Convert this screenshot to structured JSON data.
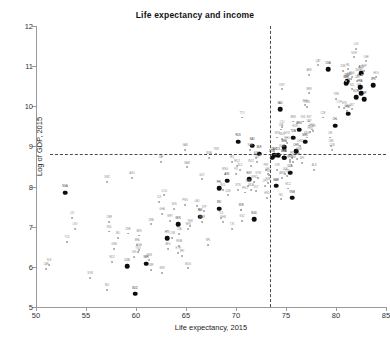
{
  "chart_data": {
    "type": "scatter",
    "title": "Life expectancy and income",
    "xlabel": "Life expectancy, 2015",
    "ylabel": "Log of GDP, 2015",
    "xlim": [
      50,
      85
    ],
    "ylim": [
      5,
      12
    ],
    "xticks": [
      50,
      55,
      60,
      65,
      70,
      75,
      80,
      85
    ],
    "yticks": [
      5,
      6,
      7,
      8,
      9,
      10,
      11,
      12
    ],
    "grid": false,
    "legend": "none",
    "reference_lines": [
      {
        "orientation": "horizontal",
        "value": 8.8,
        "style": "dashed",
        "color": "#4a4a4a"
      },
      {
        "orientation": "vertical",
        "value": 73.4,
        "style": "dashed",
        "color": "#4a4a4a"
      }
    ],
    "marker_styles": {
      "highlighted": {
        "color": "#0d0d0d",
        "size": "large"
      },
      "regular": {
        "color": "#9d9d9d",
        "size": "small"
      }
    },
    "points": [
      {
        "label": "CAF",
        "x": 51.0,
        "y": 5.95,
        "h": false
      },
      {
        "label": "NGA",
        "x": 52.9,
        "y": 7.85,
        "h": true
      },
      {
        "label": "SLE",
        "x": 51.3,
        "y": 6.05,
        "h": false
      },
      {
        "label": "TCD",
        "x": 53.1,
        "y": 6.62,
        "h": false
      },
      {
        "label": "CIV",
        "x": 53.6,
        "y": 7.22,
        "h": false
      },
      {
        "label": "LSO",
        "x": 53.9,
        "y": 6.95,
        "h": false
      },
      {
        "label": "SOM",
        "x": 55.4,
        "y": 5.72,
        "h": false
      },
      {
        "label": "SWZ",
        "x": 57.1,
        "y": 8.12,
        "h": false
      },
      {
        "label": "CMR",
        "x": 57.3,
        "y": 7.12,
        "h": false
      },
      {
        "label": "MLI",
        "x": 58.2,
        "y": 6.72,
        "h": false
      },
      {
        "label": "COD",
        "x": 59.1,
        "y": 6.02,
        "h": true
      },
      {
        "label": "BDI",
        "x": 57.1,
        "y": 5.42,
        "h": false
      },
      {
        "label": "BDI2",
        "x": 59.9,
        "y": 5.33,
        "h": true
      },
      {
        "label": "GNB",
        "x": 57.8,
        "y": 6.44,
        "h": false
      },
      {
        "label": "ZWE",
        "x": 59.2,
        "y": 6.83,
        "h": false
      },
      {
        "label": "AGO",
        "x": 59.6,
        "y": 8.22,
        "h": false
      },
      {
        "label": "BEN",
        "x": 60.3,
        "y": 6.78,
        "h": false
      },
      {
        "label": "GIN",
        "x": 59.8,
        "y": 6.25,
        "h": false
      },
      {
        "label": "BFA",
        "x": 60.1,
        "y": 6.54,
        "h": false
      },
      {
        "label": "MOZ",
        "x": 57.6,
        "y": 6.12,
        "h": false
      },
      {
        "label": "TGO",
        "x": 60.2,
        "y": 6.36,
        "h": false
      },
      {
        "label": "NER",
        "x": 61.0,
        "y": 6.08,
        "h": true
      },
      {
        "label": "UGA",
        "x": 60.3,
        "y": 6.42,
        "h": false
      },
      {
        "label": "ZMB",
        "x": 61.5,
        "y": 7.06,
        "h": false
      },
      {
        "label": "MWI",
        "x": 62.6,
        "y": 5.84,
        "h": false
      },
      {
        "label": "GMB",
        "x": 61.3,
        "y": 6.18,
        "h": false
      },
      {
        "label": "AFG",
        "x": 63.2,
        "y": 6.44,
        "h": false
      },
      {
        "label": "HTI",
        "x": 63.1,
        "y": 6.72,
        "h": true
      },
      {
        "label": "GHA",
        "x": 62.6,
        "y": 7.32,
        "h": false
      },
      {
        "label": "TZA",
        "x": 64.3,
        "y": 6.82,
        "h": false
      },
      {
        "label": "RWA",
        "x": 64.3,
        "y": 6.52,
        "h": false
      },
      {
        "label": "KEN",
        "x": 64.2,
        "y": 7.06,
        "h": true
      },
      {
        "label": "ETH",
        "x": 64.2,
        "y": 6.35,
        "h": false
      },
      {
        "label": "COG",
        "x": 62.8,
        "y": 7.78,
        "h": false
      },
      {
        "label": "SDN",
        "x": 63.8,
        "y": 7.44,
        "h": false
      },
      {
        "label": "MRT",
        "x": 63.4,
        "y": 7.15,
        "h": false
      },
      {
        "label": "SEN",
        "x": 65.2,
        "y": 6.95,
        "h": false
      },
      {
        "label": "YEM",
        "x": 65.4,
        "y": 7.02,
        "h": false
      },
      {
        "label": "PNG",
        "x": 64.9,
        "y": 7.55,
        "h": false
      },
      {
        "label": "MDG",
        "x": 65.2,
        "y": 5.96,
        "h": false
      },
      {
        "label": "LAO",
        "x": 66.1,
        "y": 7.52,
        "h": false
      },
      {
        "label": "NPL",
        "x": 67.2,
        "y": 6.55,
        "h": false
      },
      {
        "label": "PAK",
        "x": 66.4,
        "y": 7.25,
        "h": true
      },
      {
        "label": "IND",
        "x": 68.3,
        "y": 7.45,
        "h": true
      },
      {
        "label": "MMR",
        "x": 66.6,
        "y": 7.12,
        "h": false
      },
      {
        "label": "BGD",
        "x": 71.8,
        "y": 7.18,
        "h": true
      },
      {
        "label": "TKM",
        "x": 68.0,
        "y": 8.82,
        "h": false
      },
      {
        "label": "BWA",
        "x": 67.3,
        "y": 8.72,
        "h": false
      },
      {
        "label": "ZAF",
        "x": 62.5,
        "y": 8.62,
        "h": false
      },
      {
        "label": "NAM",
        "x": 65.1,
        "y": 8.48,
        "h": false
      },
      {
        "label": "GAB",
        "x": 64.9,
        "y": 8.92,
        "h": false
      },
      {
        "label": "KHM",
        "x": 68.7,
        "y": 7.12,
        "h": false
      },
      {
        "label": "BOL",
        "x": 68.7,
        "y": 7.92,
        "h": false
      },
      {
        "label": "TJK",
        "x": 69.6,
        "y": 6.95,
        "h": false
      },
      {
        "label": "UZB",
        "x": 69.2,
        "y": 7.78,
        "h": false
      },
      {
        "label": "KGZ",
        "x": 70.6,
        "y": 7.15,
        "h": false
      },
      {
        "label": "MNG",
        "x": 68.9,
        "y": 8.32,
        "h": false
      },
      {
        "label": "IDN",
        "x": 69.1,
        "y": 8.15,
        "h": true
      },
      {
        "label": "PHL",
        "x": 68.3,
        "y": 7.96,
        "h": true
      },
      {
        "label": "IRQ",
        "x": 69.6,
        "y": 8.62,
        "h": false
      },
      {
        "label": "GTM",
        "x": 72.2,
        "y": 8.22,
        "h": false
      },
      {
        "label": "EGY",
        "x": 71.3,
        "y": 8.18,
        "h": true
      },
      {
        "label": "PHL2",
        "x": 70.9,
        "y": 7.85,
        "h": false
      },
      {
        "label": "NIC",
        "x": 74.5,
        "y": 7.68,
        "h": false
      },
      {
        "label": "HND",
        "x": 73.1,
        "y": 7.72,
        "h": false
      },
      {
        "label": "MAR",
        "x": 74.0,
        "y": 8.02,
        "h": true
      },
      {
        "label": "PRY",
        "x": 73.0,
        "y": 8.42,
        "h": false
      },
      {
        "label": "SLV",
        "x": 73.3,
        "y": 8.28,
        "h": false
      },
      {
        "label": "VNM",
        "x": 75.6,
        "y": 7.72,
        "h": true
      },
      {
        "label": "PSE",
        "x": 73.2,
        "y": 8.08,
        "h": false
      },
      {
        "label": "IND2",
        "x": 71.5,
        "y": 8.52,
        "h": false
      },
      {
        "label": "JOR",
        "x": 74.1,
        "y": 8.42,
        "h": false
      },
      {
        "label": "UKR",
        "x": 71.2,
        "y": 8.02,
        "h": false
      },
      {
        "label": "SYR",
        "x": 70.5,
        "y": 7.42,
        "h": false
      },
      {
        "label": "LKA",
        "x": 74.9,
        "y": 8.32,
        "h": false
      },
      {
        "label": "DZA",
        "x": 75.4,
        "y": 8.35,
        "h": true
      },
      {
        "label": "TUN",
        "x": 75.1,
        "y": 8.26,
        "h": false
      },
      {
        "label": "ALB",
        "x": 77.8,
        "y": 8.42,
        "h": false
      },
      {
        "label": "ARM",
        "x": 74.6,
        "y": 8.22,
        "h": false
      },
      {
        "label": "GEO",
        "x": 73.2,
        "y": 8.32,
        "h": false
      },
      {
        "label": "MDA",
        "x": 71.5,
        "y": 7.92,
        "h": false
      },
      {
        "label": "BIH",
        "x": 76.6,
        "y": 8.58,
        "h": false
      },
      {
        "label": "MKD",
        "x": 75.4,
        "y": 8.62,
        "h": false
      },
      {
        "label": "SRB",
        "x": 75.4,
        "y": 8.65,
        "h": false
      },
      {
        "label": "COL",
        "x": 74.2,
        "y": 8.78,
        "h": true
      },
      {
        "label": "PER",
        "x": 74.8,
        "y": 8.72,
        "h": true
      },
      {
        "label": "ECU",
        "x": 76.1,
        "y": 8.68,
        "h": false
      },
      {
        "label": "DOM",
        "x": 73.6,
        "y": 8.72,
        "h": true
      },
      {
        "label": "BRA",
        "x": 74.8,
        "y": 8.98,
        "h": true
      },
      {
        "label": "CHN",
        "x": 76.0,
        "y": 8.88,
        "h": true
      },
      {
        "label": "THA",
        "x": 74.8,
        "y": 8.72,
        "h": true
      },
      {
        "label": "MEX",
        "x": 76.9,
        "y": 9.12,
        "h": true
      },
      {
        "label": "TUR",
        "x": 75.7,
        "y": 9.22,
        "h": true
      },
      {
        "label": "IRN",
        "x": 75.6,
        "y": 8.72,
        "h": false
      },
      {
        "label": "RUS",
        "x": 70.2,
        "y": 9.12,
        "h": true
      },
      {
        "label": "KAZ",
        "x": 71.6,
        "y": 9.02,
        "h": true
      },
      {
        "label": "BLR",
        "x": 72.3,
        "y": 8.82,
        "h": true
      },
      {
        "label": "BGR",
        "x": 74.6,
        "y": 8.88,
        "h": false
      },
      {
        "label": "ROU",
        "x": 75.1,
        "y": 9.08,
        "h": false
      },
      {
        "label": "MYS",
        "x": 75.1,
        "y": 9.22,
        "h": false
      },
      {
        "label": "ZAF2",
        "x": 73.8,
        "y": 8.78,
        "h": true
      },
      {
        "label": "LBY",
        "x": 72.1,
        "y": 8.62,
        "h": false
      },
      {
        "label": "AZE",
        "x": 72.0,
        "y": 8.72,
        "h": false
      },
      {
        "label": "CRI",
        "x": 79.4,
        "y": 9.22,
        "h": false
      },
      {
        "label": "CHL",
        "x": 79.9,
        "y": 9.52,
        "h": true
      },
      {
        "label": "URY",
        "x": 77.3,
        "y": 9.52,
        "h": false
      },
      {
        "label": "ARG",
        "x": 76.3,
        "y": 9.42,
        "h": true
      },
      {
        "label": "PAN",
        "x": 77.7,
        "y": 9.38,
        "h": false
      },
      {
        "label": "POL",
        "x": 77.6,
        "y": 9.42,
        "h": false
      },
      {
        "label": "HRV",
        "x": 77.4,
        "y": 9.35,
        "h": false
      },
      {
        "label": "HUN",
        "x": 75.9,
        "y": 9.38,
        "h": false
      },
      {
        "label": "SVK",
        "x": 76.7,
        "y": 9.62,
        "h": false
      },
      {
        "label": "LTU",
        "x": 74.6,
        "y": 9.48,
        "h": false
      },
      {
        "label": "LVA",
        "x": 74.5,
        "y": 9.42,
        "h": false
      },
      {
        "label": "EST",
        "x": 77.3,
        "y": 9.62,
        "h": false
      },
      {
        "label": "CZE",
        "x": 78.7,
        "y": 9.72,
        "h": false
      },
      {
        "label": "PRT",
        "x": 81.2,
        "y": 9.82,
        "h": true
      },
      {
        "label": "GRC",
        "x": 81.1,
        "y": 9.88,
        "h": false
      },
      {
        "label": "SVN",
        "x": 80.8,
        "y": 9.95,
        "h": false
      },
      {
        "label": "ESP",
        "x": 82.8,
        "y": 10.18,
        "h": true
      },
      {
        "label": "ITA",
        "x": 82.5,
        "y": 10.32,
        "h": true
      },
      {
        "label": "KOR",
        "x": 82.0,
        "y": 10.22,
        "h": true
      },
      {
        "label": "ISR",
        "x": 82.3,
        "y": 10.42,
        "h": false
      },
      {
        "label": "FRA",
        "x": 82.4,
        "y": 10.48,
        "h": true
      },
      {
        "label": "GBR",
        "x": 81.0,
        "y": 10.58,
        "h": true
      },
      {
        "label": "JPN",
        "x": 83.7,
        "y": 10.52,
        "h": true
      },
      {
        "label": "DEU",
        "x": 81.1,
        "y": 10.62,
        "h": true
      },
      {
        "label": "CAN",
        "x": 82.1,
        "y": 10.62,
        "h": false
      },
      {
        "label": "BEL",
        "x": 81.0,
        "y": 10.62,
        "h": false
      },
      {
        "label": "AUT",
        "x": 81.5,
        "y": 10.68,
        "h": false
      },
      {
        "label": "NLD",
        "x": 81.6,
        "y": 10.72,
        "h": false
      },
      {
        "label": "FIN",
        "x": 81.3,
        "y": 10.68,
        "h": false
      },
      {
        "label": "SWE",
        "x": 82.2,
        "y": 10.78,
        "h": false
      },
      {
        "label": "AUS",
        "x": 82.5,
        "y": 10.82,
        "h": true
      },
      {
        "label": "DNK",
        "x": 80.7,
        "y": 10.88,
        "h": false
      },
      {
        "label": "IRL",
        "x": 81.2,
        "y": 10.92,
        "h": false
      },
      {
        "label": "ISL",
        "x": 82.6,
        "y": 10.78,
        "h": false
      },
      {
        "label": "USA",
        "x": 79.2,
        "y": 10.92,
        "h": true
      },
      {
        "label": "SGP",
        "x": 82.8,
        "y": 10.88,
        "h": false
      },
      {
        "label": "CHE",
        "x": 83.0,
        "y": 11.12,
        "h": false
      },
      {
        "label": "NOR",
        "x": 81.8,
        "y": 11.22,
        "h": false
      },
      {
        "label": "LUX",
        "x": 82.0,
        "y": 11.42,
        "h": false
      },
      {
        "label": "QAT",
        "x": 78.2,
        "y": 11.02,
        "h": false
      },
      {
        "label": "ARE",
        "x": 77.3,
        "y": 10.78,
        "h": false
      },
      {
        "label": "KWT",
        "x": 74.6,
        "y": 10.42,
        "h": false
      },
      {
        "label": "SAU",
        "x": 74.4,
        "y": 9.92,
        "h": true
      },
      {
        "label": "OMN",
        "x": 77.1,
        "y": 9.98,
        "h": false
      },
      {
        "label": "BHR",
        "x": 76.9,
        "y": 10.02,
        "h": false
      },
      {
        "label": "CYP",
        "x": 80.3,
        "y": 9.98,
        "h": false
      },
      {
        "label": "MLT",
        "x": 81.6,
        "y": 9.92,
        "h": false
      },
      {
        "label": "NZL",
        "x": 81.6,
        "y": 10.42,
        "h": false
      },
      {
        "label": "HKG",
        "x": 84.0,
        "y": 10.72,
        "h": false
      },
      {
        "label": "TWN",
        "x": 80.0,
        "y": 10.18,
        "h": false
      },
      {
        "label": "MUS",
        "x": 74.6,
        "y": 9.18,
        "h": false
      },
      {
        "label": "CUB",
        "x": 79.6,
        "y": 8.92,
        "h": false
      },
      {
        "label": "JAM",
        "x": 75.7,
        "y": 8.62,
        "h": false
      },
      {
        "label": "VEN",
        "x": 74.1,
        "y": 9.22,
        "h": false
      },
      {
        "label": "LBN",
        "x": 79.5,
        "y": 9.02,
        "h": false
      },
      {
        "label": "MNE",
        "x": 76.3,
        "y": 8.82,
        "h": false
      },
      {
        "label": "BRB",
        "x": 75.7,
        "y": 9.62,
        "h": false
      },
      {
        "label": "TTO",
        "x": 70.6,
        "y": 9.72,
        "h": false
      },
      {
        "label": "FJI",
        "x": 70.0,
        "y": 8.32,
        "h": false
      },
      {
        "label": "BTN",
        "x": 70.2,
        "y": 7.92,
        "h": false
      },
      {
        "label": "CPV",
        "x": 72.9,
        "y": 8.02,
        "h": false
      },
      {
        "label": "STP",
        "x": 66.8,
        "y": 7.38,
        "h": false
      },
      {
        "label": "TLS",
        "x": 68.5,
        "y": 7.22,
        "h": false
      },
      {
        "label": "SLB",
        "x": 70.5,
        "y": 7.42,
        "h": false
      },
      {
        "label": "VUT",
        "x": 72.0,
        "y": 7.88,
        "h": false
      },
      {
        "label": "COM",
        "x": 63.6,
        "y": 6.72,
        "h": false
      },
      {
        "label": "DJI",
        "x": 62.3,
        "y": 7.62,
        "h": false
      },
      {
        "label": "ERI",
        "x": 64.6,
        "y": 6.28,
        "h": false
      },
      {
        "label": "SSD",
        "x": 57.3,
        "y": 6.88,
        "h": false
      },
      {
        "label": "LBR",
        "x": 61.5,
        "y": 5.92,
        "h": false
      },
      {
        "label": "NIC2",
        "x": 75.2,
        "y": 7.95,
        "h": false
      },
      {
        "label": "CHN2",
        "x": 76.4,
        "y": 9.02,
        "h": false
      },
      {
        "label": "UKR2",
        "x": 71.8,
        "y": 8.12,
        "h": false
      },
      {
        "label": "IRQ2",
        "x": 70.1,
        "y": 8.52,
        "h": false
      },
      {
        "label": "BLZ",
        "x": 70.4,
        "y": 8.42,
        "h": false
      },
      {
        "label": "SUR",
        "x": 71.4,
        "y": 8.92,
        "h": false
      },
      {
        "label": "GUY",
        "x": 66.6,
        "y": 8.18,
        "h": false
      },
      {
        "label": "MDV",
        "x": 77.1,
        "y": 9.22,
        "h": false
      },
      {
        "label": "BRN",
        "x": 77.3,
        "y": 10.32,
        "h": false
      }
    ]
  }
}
